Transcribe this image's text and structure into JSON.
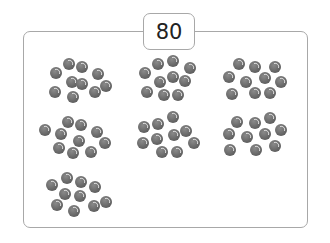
{
  "label": "80",
  "groups": [
    {
      "count": 10,
      "pattern": "a"
    },
    {
      "count": 10,
      "pattern": "b"
    },
    {
      "count": 10,
      "pattern": "c"
    },
    {
      "count": 10,
      "pattern": "d"
    },
    {
      "count": 10,
      "pattern": "e"
    },
    {
      "count": 10,
      "pattern": "f"
    },
    {
      "count": 10,
      "pattern": "g"
    }
  ],
  "colors": {
    "ball": "#6f6f6f",
    "border": "#a8a8a8"
  }
}
